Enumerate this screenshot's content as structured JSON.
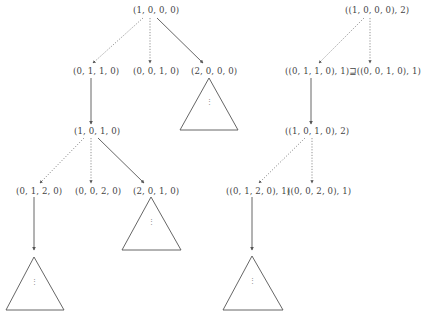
{
  "left_tree": {
    "root": "(1, 0, 0, 0)",
    "level1": [
      "(0, 1, 1, 0)",
      "(0, 0, 1, 0)",
      "(2, 0, 0, 0)"
    ],
    "level2": "(1, 0, 1, 0)",
    "level3": [
      "(0, 1, 2, 0)",
      "(0, 0, 2, 0)",
      "(2, 0, 1, 0)"
    ]
  },
  "right_tree": {
    "root": "((1, 0, 0, 0), 2)",
    "level1": "((0, 1, 1, 0), 1)⊒((0, 0, 1, 0), 1)",
    "level2": "((1, 0, 1, 0), 2)",
    "level3": [
      "((0, 1, 2, 0), 1)",
      "((0, 0, 2, 0), 1)"
    ]
  },
  "subtree_ellipsis": "⋮",
  "edge_styles": {
    "solid": "solid-arrow",
    "dotted": "dotted-arrow"
  },
  "colors": {
    "line": "#555555",
    "text": "#444444",
    "background": "#ffffff"
  }
}
